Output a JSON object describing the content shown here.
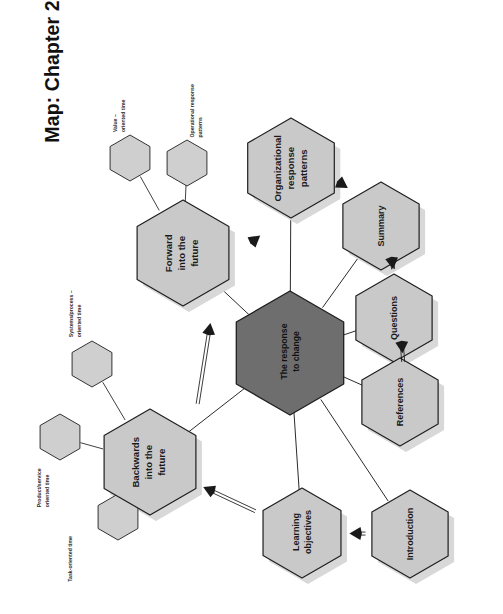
{
  "page": {
    "title": "Map: Chapter 2",
    "background_color": "#ffffff",
    "orientation": "rotated-90-ccw"
  },
  "palette": {
    "node_fill": "#c9c9c9",
    "node_stroke": "#1f1f1f",
    "center_fill": "#6e6e6e",
    "center_stroke": "#1f1f1f",
    "shadow": "#d8d8d8",
    "leaf_fill": "#cfcfcf",
    "line": "#2b2b2b",
    "arrow": "#1a1a1a",
    "text": "#111111"
  },
  "chart_data": {
    "type": "diagram",
    "subtype": "mind-map",
    "title": "Map: Chapter 2",
    "center": {
      "id": "response-to-change",
      "label": "The response\nto change",
      "fill": "#6e6e6e"
    },
    "nodes": [
      {
        "id": "forward-into-the-future",
        "label": "Forward\ninto the\nfuture",
        "fill": "#c9c9c9"
      },
      {
        "id": "backwards-into-the-future",
        "label": "Backwards\ninto the\nfuture",
        "fill": "#c9c9c9"
      },
      {
        "id": "organizational-response",
        "label": "Organizational\nresponse\npatterns",
        "fill": "#c9c9c9"
      },
      {
        "id": "summary",
        "label": "Summary",
        "fill": "#c9c9c9"
      },
      {
        "id": "questions",
        "label": "Questions",
        "fill": "#c9c9c9"
      },
      {
        "id": "references",
        "label": "References",
        "fill": "#c9c9c9"
      },
      {
        "id": "learning-objectives",
        "label": "Learning\nobjectives",
        "fill": "#c9c9c9"
      },
      {
        "id": "introduction",
        "label": "Introduction",
        "fill": "#c9c9c9"
      }
    ],
    "leaf_nodes": [
      {
        "id": "value-oriented-time",
        "label": "Value –\noriented time",
        "parent": "forward-into-the-future"
      },
      {
        "id": "operational-response-patterns",
        "label": "Operational response\npatterns",
        "parent": "forward-into-the-future"
      },
      {
        "id": "systems-process-oriented-time",
        "label": "Systems/process –\noriented time",
        "parent": "backwards-into-the-future"
      },
      {
        "id": "product-service-oriented-time",
        "label": "Product/service\noriented time",
        "parent": "backwards-into-the-future"
      },
      {
        "id": "task-oriented-time",
        "label": "Task-oriented time",
        "parent": "backwards-into-the-future"
      }
    ],
    "edges": [
      {
        "from": "response-to-change",
        "to": "forward-into-the-future",
        "style": "line"
      },
      {
        "from": "response-to-change",
        "to": "backwards-into-the-future",
        "style": "line"
      },
      {
        "from": "response-to-change",
        "to": "organizational-response",
        "style": "line"
      },
      {
        "from": "response-to-change",
        "to": "summary",
        "style": "line"
      },
      {
        "from": "response-to-change",
        "to": "questions",
        "style": "line"
      },
      {
        "from": "response-to-change",
        "to": "references",
        "style": "line"
      },
      {
        "from": "response-to-change",
        "to": "learning-objectives",
        "style": "line"
      },
      {
        "from": "response-to-change",
        "to": "introduction",
        "style": "line"
      },
      {
        "from": "introduction",
        "to": "learning-objectives",
        "style": "arrow"
      },
      {
        "from": "learning-objectives",
        "to": "backwards-into-the-future",
        "style": "arrow"
      },
      {
        "from": "backwards-into-the-future",
        "to": "forward-into-the-future",
        "style": "arrow"
      },
      {
        "from": "forward-into-the-future",
        "to": "organizational-response",
        "style": "arrow"
      },
      {
        "from": "organizational-response",
        "to": "summary",
        "style": "arrow"
      },
      {
        "from": "summary",
        "to": "questions",
        "style": "arrow"
      },
      {
        "from": "questions",
        "to": "references",
        "style": "arrow"
      }
    ]
  }
}
